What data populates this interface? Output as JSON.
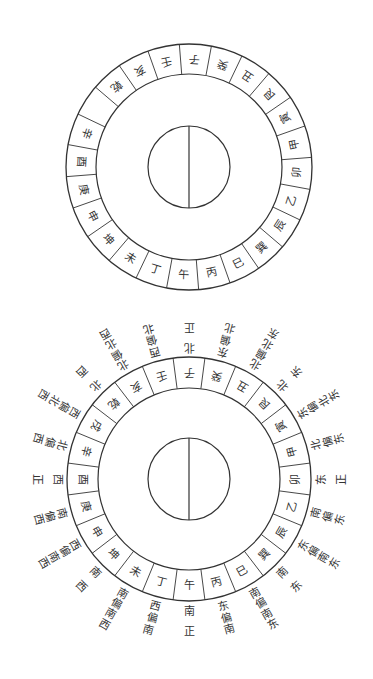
{
  "diagrams": [
    {
      "id": "compass-ring-plain",
      "center": [
        189,
        167
      ],
      "outer_radius": 123,
      "ring_inner_radius": 93,
      "core_radius": 41,
      "rotation_offset_deg": 3,
      "ring_segments": [
        "子",
        "癸",
        "丑",
        "艮",
        "寅",
        "甲",
        "卯",
        "乙",
        "辰",
        "巽",
        "巳",
        "丙",
        "午",
        "丁",
        "未",
        "坤",
        "申",
        "庚",
        "酉",
        "辛",
        "",
        "乾",
        "亥",
        "壬"
      ],
      "outer_labels": []
    },
    {
      "id": "compass-ring-labeled",
      "center": [
        189,
        479
      ],
      "outer_radius": 122,
      "ring_inner_radius": 91,
      "core_radius": 41,
      "rotation_offset_deg": 0,
      "ring_segments": [
        "子",
        "癸",
        "丑",
        "艮",
        "寅",
        "甲",
        "卯",
        "乙",
        "辰",
        "巽",
        "巳",
        "丙",
        "午",
        "丁",
        "未",
        "坤",
        "申",
        "庚",
        "酉",
        "辛",
        "戌",
        "乾",
        "亥",
        "壬"
      ],
      "outer_labels": [
        "正北",
        "北偏东",
        "东北偏北",
        "东北",
        "东北偏东",
        "东偏北",
        "正东",
        "东偏南",
        "东南偏东",
        "东南",
        "东南偏南",
        "南偏东",
        "正南",
        "南偏西",
        "西南偏南",
        "西南",
        "西南偏西",
        "西偏南",
        "正西",
        "西偏北",
        "西北偏西",
        "西北",
        "西北偏北",
        "北偏西"
      ]
    }
  ],
  "style": {
    "stroke_color": "#333333",
    "text_color": "#333333",
    "background": "#ffffff"
  }
}
